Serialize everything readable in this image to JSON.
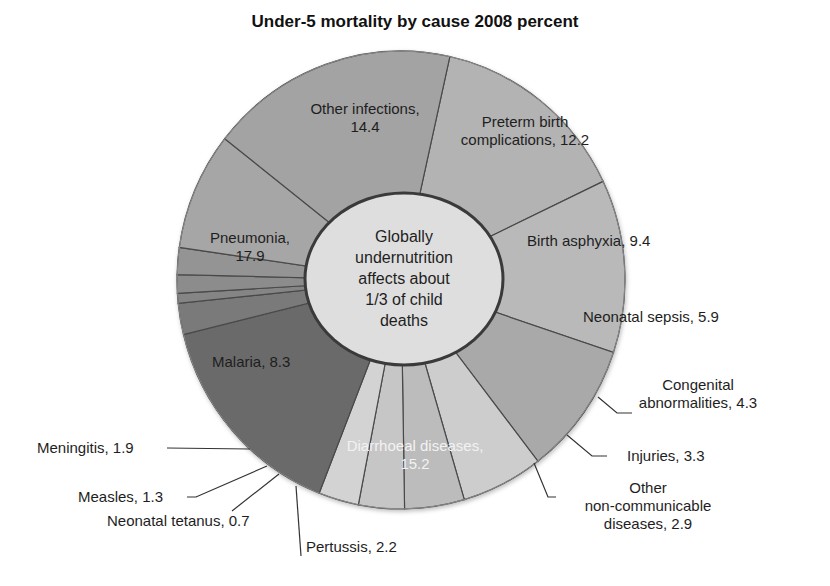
{
  "chart_data": {
    "type": "pie",
    "variant": "donut",
    "title": "Under-5 mortality by cause 2008 percent",
    "unit": "percent",
    "center_text": [
      "Globally",
      "undernutrition",
      "affects about",
      "1/3 of child",
      "deaths"
    ],
    "categories": [
      "Other infections",
      "Preterm birth complications",
      "Birth asphyxia",
      "Neonatal sepsis",
      "Congenital abnormalities",
      "Injuries",
      "Other non-communicable diseases",
      "Diarrhoeal diseases",
      "Pertussis",
      "Neonatal tetanus",
      "Measles",
      "Meningitis",
      "Malaria",
      "Pneumonia"
    ],
    "values": [
      14.4,
      12.2,
      9.4,
      5.9,
      4.3,
      3.3,
      2.9,
      15.2,
      2.2,
      0.7,
      1.3,
      1.9,
      8.3,
      17.9
    ],
    "slices": [
      {
        "label": "Other infections",
        "value": 14.4,
        "color": "#b3b3b3"
      },
      {
        "label": "Preterm birth complications",
        "value": 12.2,
        "color": "#b9b9b9"
      },
      {
        "label": "Birth asphyxia",
        "value": 9.4,
        "color": "#a9a9a9"
      },
      {
        "label": "Neonatal sepsis",
        "value": 5.9,
        "color": "#cdcdcd"
      },
      {
        "label": "Congenital abnormalities",
        "value": 4.3,
        "color": "#bcbcbc"
      },
      {
        "label": "Injuries",
        "value": 3.3,
        "color": "#c6c6c6"
      },
      {
        "label": "Other non-communicable diseases",
        "value": 2.9,
        "color": "#d3d3d3"
      },
      {
        "label": "Diarrhoeal diseases",
        "value": 15.2,
        "color": "#6a6a6a"
      },
      {
        "label": "Pertussis",
        "value": 2.2,
        "color": "#7a7a7a"
      },
      {
        "label": "Neonatal tetanus",
        "value": 0.7,
        "color": "#858585"
      },
      {
        "label": "Measles",
        "value": 1.3,
        "color": "#8c8c8c"
      },
      {
        "label": "Meningitis",
        "value": 1.9,
        "color": "#949494"
      },
      {
        "label": "Malaria",
        "value": 8.3,
        "color": "#a6a6a6"
      },
      {
        "label": "Pneumonia",
        "value": 17.9,
        "color": "#a3a3a3"
      }
    ],
    "start_angle_deg": 372.6,
    "legend": "none (direct labels)"
  },
  "labels": {
    "other_infections": [
      "Other infections,",
      "14.4"
    ],
    "preterm": [
      "Preterm birth",
      "complications, 12.2"
    ],
    "birth_asphyxia": "Birth asphyxia, 9.4",
    "neonatal_sepsis": "Neonatal sepsis, 5.9",
    "congenital": [
      "Congenital",
      "abnormalities, 4.3"
    ],
    "injuries": "Injuries, 3.3",
    "other_ncd": [
      "Other",
      "non-communicable",
      "diseases, 2.9"
    ],
    "diarrhoeal": [
      "Diarrhoeal diseases,",
      "15.2"
    ],
    "pertussis": "Pertussis, 2.2",
    "neonatal_tetanus": "Neonatal tetanus, 0.7",
    "measles": "Measles, 1.3",
    "meningitis": "Meningitis, 1.9",
    "malaria": "Malaria, 8.3",
    "pneumonia": [
      "Pneumonia,",
      "17.9"
    ]
  }
}
